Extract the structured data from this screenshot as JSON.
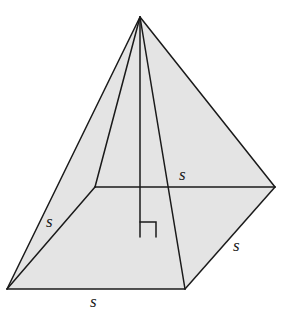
{
  "diagram": {
    "type": "square-pyramid",
    "colors": {
      "fill": "#e4e4e4",
      "stroke": "#1a1a1a",
      "background": "#ffffff"
    },
    "vertices": {
      "apex": [
        140,
        17
      ],
      "front_left": [
        7,
        289
      ],
      "front_right": [
        185,
        289
      ],
      "back_right": [
        275,
        187
      ],
      "back_left": [
        95,
        187
      ],
      "height_foot": [
        140,
        237
      ]
    },
    "labels": {
      "back_edge": "s",
      "left_edge": "s",
      "right_edge": "s",
      "front_edge": "s"
    },
    "right_angle_marker": true
  }
}
